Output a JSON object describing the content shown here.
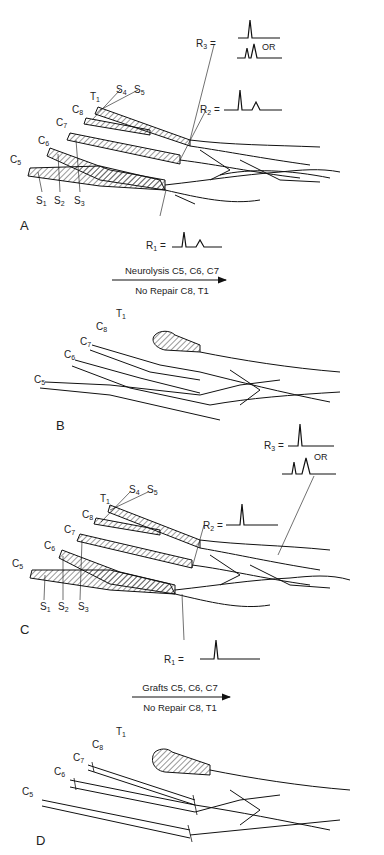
{
  "figure": {
    "panels": [
      {
        "id": "A",
        "label": "A",
        "roots": [
          "C5",
          "C6",
          "C7",
          "C8",
          "T1"
        ],
        "stumps": [
          "S1",
          "S2",
          "S3",
          "S4",
          "S5"
        ],
        "recordings": [
          {
            "id": "R1",
            "label": "R1 =",
            "waveform": "double-peak"
          },
          {
            "id": "R2",
            "label": "R2 =",
            "waveform": "double-peak"
          },
          {
            "id": "R3",
            "label": "R3 =",
            "waveform": "single-peak",
            "alt_label": "OR",
            "alt_waveform": "double-peak"
          }
        ]
      },
      {
        "id": "B",
        "label": "B",
        "roots": [
          "C5",
          "C6",
          "C7",
          "C8",
          "T1"
        ]
      },
      {
        "id": "C",
        "label": "C",
        "roots": [
          "C5",
          "C6",
          "C7",
          "C8",
          "T1"
        ],
        "stumps": [
          "S1",
          "S2",
          "S3",
          "S4",
          "S5"
        ],
        "recordings": [
          {
            "id": "R1",
            "label": "R1 =",
            "waveform": "single-peak"
          },
          {
            "id": "R2",
            "label": "R2 =",
            "waveform": "single-peak"
          },
          {
            "id": "R3",
            "label": "R3 =",
            "waveform": "single-peak",
            "alt_label": "OR",
            "alt_waveform": "double-peak"
          }
        ]
      },
      {
        "id": "D",
        "label": "D",
        "roots": [
          "C5",
          "C6",
          "C7",
          "C8",
          "T1"
        ]
      }
    ],
    "transitions": [
      {
        "from": "A",
        "to": "B",
        "top": "Neurolysis C5, C6, C7",
        "bottom": "No Repair C8, T1"
      },
      {
        "from": "C",
        "to": "D",
        "top": "Grafts C5, C6, C7",
        "bottom": "No Repair C8, T1"
      }
    ]
  },
  "text": {
    "R": "R",
    "S": "S",
    "C": "C",
    "T": "T",
    "OR": "OR",
    "eq": " =",
    "A": "A",
    "B": "B",
    "Cpanel": "C",
    "D": "D",
    "n1": "1",
    "n2": "2",
    "n3": "3",
    "n4": "4",
    "n5": "5",
    "n6": "6",
    "n7": "7",
    "n8": "8",
    "t1_top": "Neurolysis C",
    "t1_c5": "5",
    "t1_sep": ", C",
    "t1_c6": "6",
    "t1_c7": "7",
    "t1_bottom": "No Repair C",
    "t1_c8": "8",
    "t1_t": ", T",
    "t1_t1": "1",
    "t2_top": "Grafts C"
  }
}
